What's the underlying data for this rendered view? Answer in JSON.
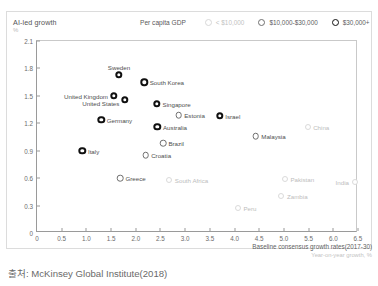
{
  "header": {
    "title": "AI-led growth",
    "unit": "%"
  },
  "legend": {
    "title": "Per capita GDP",
    "items": [
      {
        "label": "< $10,000",
        "weight": "w1"
      },
      {
        "label": "$10,000-$30,000",
        "weight": "w2"
      },
      {
        "label": "$30,000+",
        "weight": "w3"
      }
    ]
  },
  "axis": {
    "x_caption": "Baseline consensus growth rates(2017-30)",
    "x_caption_sub": "Year-on-year growth, %"
  },
  "source": "출처: McKinsey Global Institute(2018)",
  "chart_data": {
    "type": "scatter",
    "title": "AI-led growth",
    "xlabel": "Baseline consensus growth rates(2017-30)",
    "ylabel": "AI-led growth",
    "xunit": "Year-on-year growth, %",
    "yunit": "%",
    "xlim": [
      0,
      6.5
    ],
    "ylim": [
      0,
      2.1
    ],
    "xticks": [
      "0",
      "0.5",
      "1.0",
      "1.5",
      "2.0",
      "2.5",
      "3.0",
      "3.5",
      "4.0",
      "4.5",
      "5.0",
      "5.5",
      "6.0",
      "6.5"
    ],
    "yticks": [
      "0",
      "0.3",
      "0.6",
      "0.9",
      "1.2",
      "1.5",
      "1.8",
      "2.1"
    ],
    "grid": false,
    "legend_position": "top-right",
    "series": [
      {
        "name": "< $10,000",
        "weight": "w1"
      },
      {
        "name": "$10,000-$30,000",
        "weight": "w2"
      },
      {
        "name": "$30,000+",
        "weight": "w3"
      }
    ],
    "points": [
      {
        "name": "Sweden",
        "x": 1.66,
        "y": 1.73,
        "weight": "w3",
        "label_pos": "center-above"
      },
      {
        "name": "South Korea",
        "x": 2.17,
        "y": 1.65,
        "weight": "w3",
        "label_pos": "right"
      },
      {
        "name": "United Kingdom",
        "x": 1.55,
        "y": 1.5,
        "weight": "w3",
        "label_pos": "left"
      },
      {
        "name": "United States",
        "x": 1.78,
        "y": 1.46,
        "weight": "w3",
        "label_pos": "below-left"
      },
      {
        "name": "Singapore",
        "x": 2.43,
        "y": 1.41,
        "weight": "w3",
        "label_pos": "right"
      },
      {
        "name": "Estonia",
        "x": 2.87,
        "y": 1.29,
        "weight": "w2",
        "label_pos": "right"
      },
      {
        "name": "Israel",
        "x": 3.7,
        "y": 1.28,
        "weight": "w3",
        "label_pos": "right"
      },
      {
        "name": "Germany",
        "x": 1.3,
        "y": 1.24,
        "weight": "w3",
        "label_pos": "right"
      },
      {
        "name": "Australia",
        "x": 2.44,
        "y": 1.16,
        "weight": "w3",
        "label_pos": "right"
      },
      {
        "name": "China",
        "x": 5.48,
        "y": 1.16,
        "weight": "w1",
        "label_pos": "right"
      },
      {
        "name": "Malaysia",
        "x": 4.43,
        "y": 1.06,
        "weight": "w2",
        "label_pos": "right"
      },
      {
        "name": "Brazil",
        "x": 2.55,
        "y": 0.98,
        "weight": "w2",
        "label_pos": "right"
      },
      {
        "name": "Italy",
        "x": 0.92,
        "y": 0.9,
        "weight": "w3",
        "label_pos": "right"
      },
      {
        "name": "Croatia",
        "x": 2.2,
        "y": 0.85,
        "weight": "w2",
        "label_pos": "right"
      },
      {
        "name": "Greece",
        "x": 1.68,
        "y": 0.6,
        "weight": "w2",
        "label_pos": "right"
      },
      {
        "name": "South Africa",
        "x": 2.68,
        "y": 0.58,
        "weight": "w1",
        "label_pos": "right"
      },
      {
        "name": "Pakistan",
        "x": 5.02,
        "y": 0.59,
        "weight": "w1",
        "label_pos": "right"
      },
      {
        "name": "India",
        "x": 6.43,
        "y": 0.56,
        "weight": "w1",
        "label_pos": "left"
      },
      {
        "name": "Zambia",
        "x": 4.95,
        "y": 0.4,
        "weight": "w1",
        "label_pos": "right"
      },
      {
        "name": "Peru",
        "x": 4.07,
        "y": 0.27,
        "weight": "w1",
        "label_pos": "right"
      }
    ]
  }
}
